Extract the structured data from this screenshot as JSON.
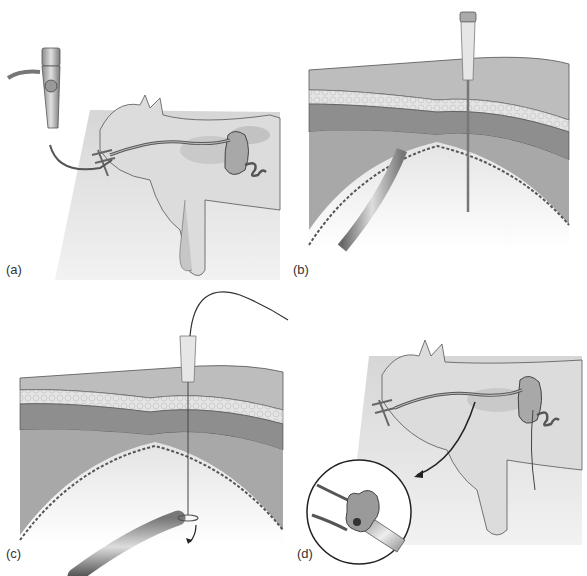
{
  "figure": {
    "panels": [
      {
        "id": "a",
        "label": "(a)",
        "description": "Endoscope passed through mouth gag into stomach of cat in lateral recumbency"
      },
      {
        "id": "b",
        "label": "(b)",
        "description": "Over-the-needle catheter inserted through abdominal wall into insufflated stomach, endoscope visible"
      },
      {
        "id": "c",
        "label": "(c)",
        "description": "Guide wire passed through catheter and grasped by endoscope snare"
      },
      {
        "id": "d",
        "label": "(d)",
        "description": "Gastrostomy tube pulled through oesophagus into stomach; inset shows mushroom tip"
      }
    ]
  },
  "colors": {
    "background": "#ffffff",
    "table": "#e4e4e4",
    "fur": "#d8d8d8",
    "fur_shade": "#a8a8a8",
    "skin_layer": "#b8b8b8",
    "fat_layer": "#e2e2e2",
    "muscle_layer": "#8e8e8e",
    "peritoneum": "#a4a4a4",
    "lumen": "#d9d9d9",
    "outline": "#4a4a4a",
    "label_text": "#333333"
  }
}
